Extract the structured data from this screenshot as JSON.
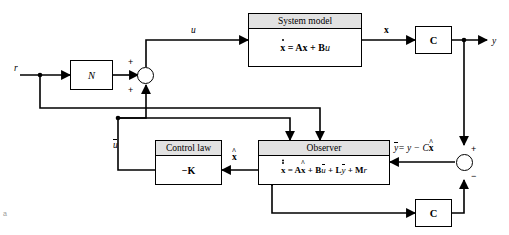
{
  "diagram": {
    "corner_mark": "a",
    "line_color": "#000000",
    "title_bar_color": "#e2e2e2",
    "background": "#ffffff"
  },
  "blocks": {
    "system_model": {
      "title": "System model",
      "equation_xdot": "x",
      "equation_rest": "= Ax + B",
      "equation_u": "u"
    },
    "observer": {
      "title": "Observer",
      "eq_lhs": "x",
      "eq_rhs_a": "= A",
      "eq_xhat": "x",
      "eq_plus_b": "+ B",
      "eq_ubar": "u",
      "eq_plus_l": "+ L",
      "eq_ybar": "y",
      "eq_plus_m": "+ M",
      "eq_r": "r"
    },
    "control_law": {
      "title": "Control law",
      "gain": "−K"
    },
    "gain_n": {
      "label": "N"
    },
    "output_matrix_top": {
      "label": "C"
    },
    "output_matrix_bottom": {
      "label": "C"
    }
  },
  "signals": {
    "reference": "r",
    "control_input": "u",
    "state": "x",
    "output": "y",
    "state_estimate": "x",
    "control_law_output": "u",
    "innovation_label_ybar": "y",
    "innovation_label_eq": "= y − C",
    "innovation_label_xhat": "x"
  },
  "summing_junctions": {
    "input_sum": {
      "sign_left": "+",
      "sign_bottom": "+"
    },
    "output_sum": {
      "sign_top": "+",
      "sign_bottom": "−"
    }
  }
}
